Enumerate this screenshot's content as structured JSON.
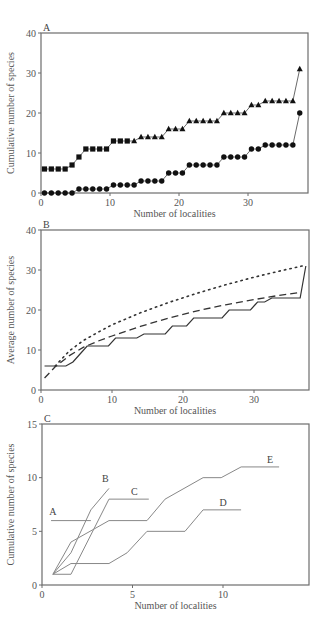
{
  "figure": {
    "panels": [
      {
        "letter": "A",
        "ylabel": "Cumulative number of species",
        "xlabel": "Number of localities"
      },
      {
        "letter": "B",
        "ylabel": "Average number of species",
        "xlabel": "Number of localities"
      },
      {
        "letter": "C",
        "ylabel": "Cumulative number of species",
        "xlabel": "Number of localities"
      }
    ]
  },
  "chart_data": [
    {
      "panel": "A",
      "type": "line",
      "title": "A",
      "xlabel": "Number of localities",
      "ylabel": "Cumulative number of species",
      "xlim": [
        0,
        38.7
      ],
      "ylim": [
        0,
        40
      ],
      "xticks": [
        0,
        10,
        20,
        30
      ],
      "yticks": [
        0,
        10,
        20,
        30,
        40
      ],
      "grid": false,
      "legend": null,
      "x": [
        0.5,
        1.5,
        2.5,
        3.5,
        4.5,
        5.5,
        6.5,
        7.5,
        8.5,
        9.5,
        10.5,
        11.5,
        12.5,
        13.5,
        14.5,
        15.5,
        16.5,
        17.5,
        18.5,
        19.5,
        20.5,
        21.5,
        22.5,
        23.5,
        24.5,
        25.5,
        26.5,
        27.5,
        28.5,
        29.5,
        30.5,
        31.5,
        32.5,
        33.5,
        34.5,
        35.5,
        36.5,
        37.5
      ],
      "series": [
        {
          "name": "upper (squares then triangles)",
          "markers": [
            "square",
            "square",
            "square",
            "square",
            "square",
            "square",
            "square",
            "square",
            "square",
            "square",
            "square",
            "square",
            "square",
            "triangle",
            "triangle",
            "triangle",
            "triangle",
            "triangle",
            "triangle",
            "triangle",
            "triangle",
            "triangle",
            "triangle",
            "triangle",
            "triangle",
            "triangle",
            "triangle",
            "triangle",
            "triangle",
            "triangle",
            "triangle",
            "triangle",
            "triangle",
            "triangle",
            "triangle",
            "triangle",
            "triangle",
            "triangle"
          ],
          "values": [
            6,
            6,
            6,
            6,
            7,
            9,
            11,
            11,
            11,
            11,
            13,
            13,
            13,
            13,
            14,
            14,
            14,
            14,
            16,
            16,
            16,
            18,
            18,
            18,
            18,
            18,
            20,
            20,
            20,
            20,
            22,
            22,
            23,
            23,
            23,
            23,
            23,
            31
          ]
        },
        {
          "name": "lower (circles)",
          "marker": "circle",
          "values": [
            0,
            0,
            0,
            0,
            0,
            1,
            1,
            1,
            1,
            1,
            2,
            2,
            2,
            2,
            3,
            3,
            3,
            3,
            5,
            5,
            5,
            7,
            7,
            7,
            7,
            7,
            9,
            9,
            9,
            9,
            11,
            11,
            12,
            12,
            12,
            12,
            12,
            20
          ]
        }
      ]
    },
    {
      "panel": "B",
      "type": "line",
      "title": "B",
      "xlabel": "Number of localities",
      "ylabel": "Average number of species",
      "xlim": [
        0,
        37.8
      ],
      "ylim": [
        0,
        40
      ],
      "xticks": [
        0,
        10,
        20,
        30
      ],
      "yticks": [
        0,
        10,
        20,
        30,
        40
      ],
      "grid": false,
      "legend": null,
      "series": [
        {
          "name": "observed (solid step)",
          "style": "solid",
          "x": [
            0.5,
            3.5,
            4.5,
            5.5,
            6.5,
            9.5,
            10.5,
            13.5,
            14.5,
            17.5,
            18.5,
            20.5,
            21.5,
            25.5,
            26.5,
            29.5,
            30.5,
            31.5,
            32.5,
            36.5,
            37.3
          ],
          "values": [
            6,
            6,
            7,
            9,
            11,
            11,
            13,
            13,
            14,
            14,
            16,
            16,
            18,
            18,
            20,
            20,
            22,
            22,
            23,
            23,
            31
          ]
        },
        {
          "name": "estimator (dashed)",
          "style": "dashed",
          "x": [
            0.5,
            2,
            4,
            6,
            8,
            10,
            14,
            18,
            22,
            26,
            30,
            33,
            36.5
          ],
          "values": [
            3,
            5.8,
            8.6,
            10.7,
            12.2,
            13.5,
            15.9,
            18,
            19.8,
            21.3,
            22.6,
            23.5,
            24.4
          ]
        },
        {
          "name": "estimator (dotted)",
          "style": "dotted",
          "x": [
            2,
            4,
            6,
            8,
            10,
            14,
            18,
            22,
            26,
            30,
            34,
            37.3
          ],
          "values": [
            6,
            9.8,
            12.4,
            14.4,
            16.3,
            19.3,
            21.9,
            24.2,
            26.3,
            28.2,
            29.9,
            31.2
          ]
        }
      ]
    },
    {
      "panel": "C",
      "type": "line",
      "title": "C",
      "xlabel": "Number of localities",
      "ylabel": "Cumulative number of species",
      "xlim": [
        0,
        14.8
      ],
      "ylim": [
        0,
        15
      ],
      "xticks": [
        0,
        5,
        10
      ],
      "yticks": [
        0,
        5,
        10,
        15
      ],
      "grid": false,
      "legend": "direct labels",
      "series": [
        {
          "name": "A",
          "x": [
            0.5,
            2.7
          ],
          "values": [
            6,
            6
          ],
          "label_at": [
            0.6,
            6.5
          ]
        },
        {
          "name": "B",
          "x": [
            0.6,
            1.6,
            2.7,
            3.7
          ],
          "values": [
            1,
            3,
            7,
            9
          ],
          "label_at": [
            3.5,
            9.6
          ]
        },
        {
          "name": "C",
          "x": [
            0.6,
            1.6,
            3.7,
            5.9
          ],
          "values": [
            1,
            1,
            8,
            8
          ],
          "label_at": [
            5.1,
            8.4
          ]
        },
        {
          "name": "D",
          "x": [
            0.6,
            1.6,
            3.7,
            4.7,
            5.8,
            7.9,
            8.9,
            11.0
          ],
          "values": [
            1,
            2,
            2,
            3,
            5,
            5,
            7,
            7
          ],
          "label_at": [
            10.0,
            7.4
          ]
        },
        {
          "name": "E",
          "x": [
            0.6,
            1.6,
            3.7,
            5.8,
            6.8,
            8.9,
            9.9,
            11.0,
            13.1
          ],
          "values": [
            1,
            4,
            6,
            6,
            8,
            10,
            10,
            11,
            11
          ],
          "label_at": [
            12.6,
            11.4
          ]
        }
      ]
    }
  ]
}
